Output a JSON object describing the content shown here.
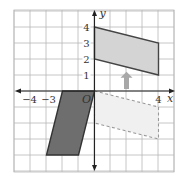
{
  "figure": {
    "type": "coordinate-plane-transformation",
    "grid": {
      "xmin": -5,
      "xmax": 4,
      "ymin": -5,
      "ymax": 5,
      "step": 1
    },
    "axes": {
      "x_label": "x",
      "y_label": "y",
      "origin_label": "O",
      "x_tick_labels": [
        {
          "value": -4,
          "text": "−4"
        },
        {
          "value": -3,
          "text": "−3"
        },
        {
          "value": 4,
          "text": "4"
        }
      ],
      "y_tick_labels": [
        {
          "value": 1,
          "text": "1"
        },
        {
          "value": 2,
          "text": "2"
        },
        {
          "value": 3,
          "text": "3"
        },
        {
          "value": 4,
          "text": "4"
        }
      ]
    },
    "shapes": [
      {
        "name": "upper-parallelogram",
        "style": "filled-light",
        "fill": "#d4d4d4",
        "stroke": "#444444",
        "vertices": [
          [
            0,
            4
          ],
          [
            4,
            3
          ],
          [
            4,
            1
          ],
          [
            0,
            2
          ]
        ]
      },
      {
        "name": "dark-parallelogram",
        "style": "filled-dark",
        "fill": "#6e6e6e",
        "stroke": "#333333",
        "vertices": [
          [
            -2,
            0
          ],
          [
            0,
            0
          ],
          [
            -1,
            -4
          ],
          [
            -3,
            -4
          ]
        ]
      },
      {
        "name": "dashed-parallelogram",
        "style": "dashed-outline",
        "fill": "#f0f0f0",
        "stroke": "#999999",
        "vertices": [
          [
            0,
            0
          ],
          [
            4,
            -1
          ],
          [
            4,
            -3
          ],
          [
            0,
            -2
          ]
        ]
      }
    ],
    "arrow": {
      "name": "translation-arrow",
      "direction": "up",
      "color": "#a8a8a8",
      "from": [
        2,
        0
      ],
      "to": [
        2,
        1.2
      ]
    }
  }
}
